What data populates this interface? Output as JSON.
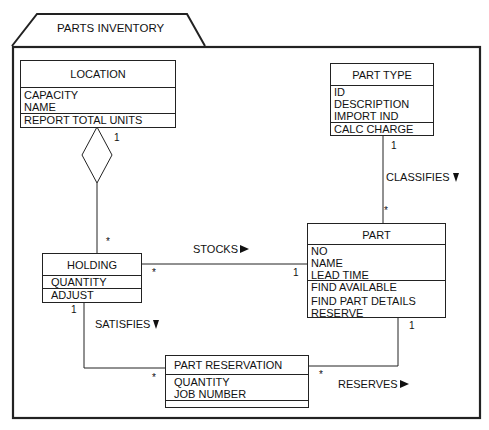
{
  "package": {
    "title": "PARTS INVENTORY"
  },
  "classes": {
    "location": {
      "name": "LOCATION",
      "attributes": [
        "CAPACITY",
        "NAME"
      ],
      "operations": [
        "REPORT TOTAL UNITS"
      ]
    },
    "part_type": {
      "name": "PART TYPE",
      "attributes": [
        "ID",
        "DESCRIPTION",
        "IMPORT IND"
      ],
      "operations": [
        "CALC CHARGE"
      ]
    },
    "part": {
      "name": "PART",
      "attributes": [
        "NO",
        "NAME",
        "LEAD TIME"
      ],
      "operations": [
        "FIND AVAILABLE",
        "FIND PART DETAILS",
        "RESERVE"
      ]
    },
    "holding": {
      "name": "HOLDING",
      "attributes": [
        "QUANTITY"
      ],
      "operations": [
        "ADJUST"
      ]
    },
    "part_reservation": {
      "name": "PART RESERVATION",
      "attributes": [
        "QUANTITY",
        "JOB NUMBER"
      ],
      "operations": []
    }
  },
  "relationships": {
    "location_holding": {
      "type": "aggregation",
      "end_location": "1",
      "end_holding": "*"
    },
    "classifies": {
      "label": "CLASSIFIES",
      "direction": "down",
      "end_part_type": "1",
      "end_part": "*"
    },
    "stocks": {
      "label": "STOCKS",
      "direction": "right",
      "end_holding": "*",
      "end_part": "1"
    },
    "satisfies": {
      "label": "SATISFIES",
      "direction": "down",
      "end_holding": "1",
      "end_reservation": "*"
    },
    "reserves": {
      "label": "RESERVES",
      "direction": "right",
      "end_part": "1",
      "end_reservation": "*"
    }
  },
  "colors": {
    "line": "#222222",
    "background": "#ffffff",
    "text": "#111111"
  }
}
